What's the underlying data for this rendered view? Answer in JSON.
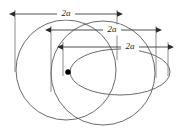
{
  "figure": {
    "background_color": "#ffffff",
    "curve_color": "#5a5a5a",
    "dimension_color": "#2b2b2b",
    "label_color": "#1c1c1c",
    "focus_marker": {
      "name": "focus-point",
      "color": "#000000",
      "cx": 68,
      "cy": 72,
      "r": 2.6
    },
    "curves": [
      {
        "id": "outer-circle",
        "shape": "circle",
        "cx": 66,
        "cy": 70,
        "rx": 50,
        "ry": 50,
        "description": "large outer circle"
      },
      {
        "id": "middle-circle",
        "shape": "circle",
        "cx": 103,
        "cy": 73,
        "rx": 52,
        "ry": 52,
        "description": "second circle offset to the right"
      },
      {
        "id": "inner-ellipse",
        "shape": "ellipse",
        "cx": 120,
        "cy": 72,
        "rx": 50,
        "ry": 23,
        "description": "flattened ellipse sharing the focus"
      }
    ],
    "dimensions": [
      {
        "id": "dim-outer",
        "label": "2a",
        "y": 14,
        "x_start": 15,
        "x_end": 117,
        "label_x": 66,
        "extension_left": {
          "x": 15,
          "y_top": 10,
          "y_bottom": 72
        },
        "extension_right": {
          "x": 117,
          "y_top": 10,
          "y_bottom": 60
        }
      },
      {
        "id": "dim-middle",
        "label": "2a",
        "y": 30,
        "x_start": 51,
        "x_end": 156,
        "label_x": 112,
        "extension_left": {
          "x": 51,
          "y_top": 26,
          "y_bottom": 92
        },
        "extension_right": {
          "x": 156,
          "y_top": 26,
          "y_bottom": 78
        }
      },
      {
        "id": "dim-inner",
        "label": "2a",
        "y": 47,
        "x_start": 63,
        "x_end": 168,
        "label_x": 130,
        "extension_left": {
          "x": 63,
          "y_top": 42,
          "y_bottom": 76
        },
        "extension_right": {
          "x": 168,
          "y_top": 42,
          "y_bottom": 76
        }
      }
    ],
    "labels": {
      "outer": "2a",
      "middle": "2a",
      "inner": "2a"
    }
  }
}
